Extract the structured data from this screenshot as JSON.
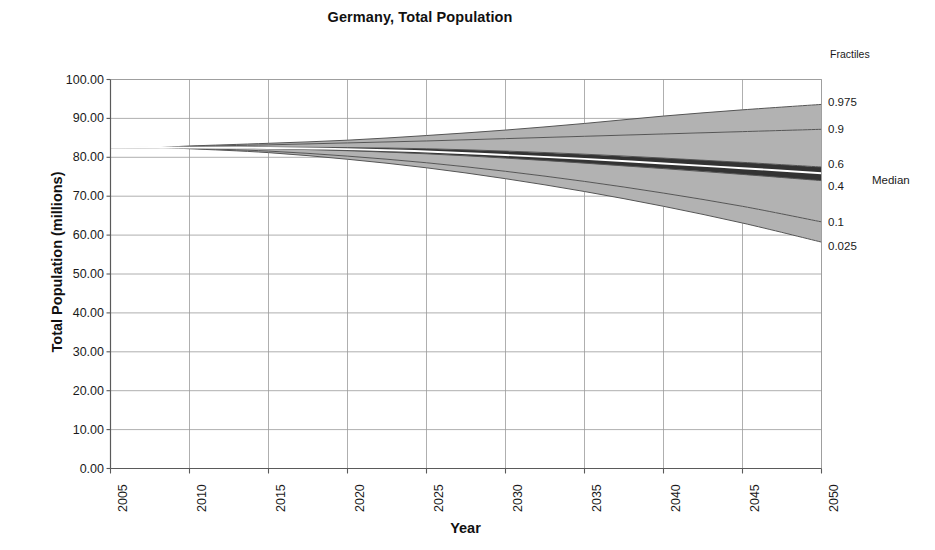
{
  "chart_data": {
    "type": "area",
    "title": "Germany, Total Population",
    "xlabel": "Year",
    "ylabel": "Total Population (millions)",
    "xlim": [
      2005,
      2050
    ],
    "ylim": [
      0,
      100
    ],
    "grid": true,
    "legend_position": "right",
    "legend_title": "Fractiles",
    "x_ticks": [
      "2005",
      "2010",
      "2015",
      "2020",
      "2025",
      "2030",
      "2035",
      "2040",
      "2045",
      "2050"
    ],
    "y_ticks": [
      "0.00",
      "10.00",
      "20.00",
      "30.00",
      "40.00",
      "50.00",
      "60.00",
      "70.00",
      "80.00",
      "90.00",
      "100.00"
    ],
    "x": [
      2005,
      2008,
      2010,
      2015,
      2020,
      2025,
      2030,
      2035,
      2040,
      2045,
      2050
    ],
    "series": [
      {
        "name": "0.975",
        "label": "0.975",
        "values": [
          82.5,
          82.5,
          82.9,
          83.6,
          84.4,
          85.6,
          87.0,
          88.7,
          90.6,
          92.2,
          93.6
        ]
      },
      {
        "name": "0.9",
        "label": "0.9",
        "values": [
          82.5,
          82.5,
          82.8,
          83.2,
          83.7,
          84.2,
          84.8,
          85.4,
          86.0,
          86.6,
          87.2
        ]
      },
      {
        "name": "0.6",
        "label": "0.6",
        "values": [
          82.5,
          82.5,
          82.6,
          82.6,
          82.5,
          82.2,
          81.6,
          80.8,
          79.8,
          78.7,
          77.5
        ]
      },
      {
        "name": "Median",
        "label": "Median",
        "values": [
          82.5,
          82.5,
          82.5,
          82.4,
          82.1,
          81.5,
          80.6,
          79.6,
          78.4,
          77.2,
          75.9
        ]
      },
      {
        "name": "0.4",
        "label": "0.4",
        "values": [
          82.5,
          82.5,
          82.5,
          82.2,
          81.7,
          80.9,
          79.8,
          78.5,
          77.1,
          75.6,
          74.0
        ]
      },
      {
        "name": "0.1",
        "label": "0.1",
        "values": [
          82.5,
          82.5,
          82.3,
          81.6,
          80.3,
          78.6,
          76.4,
          73.8,
          70.8,
          67.4,
          63.4
        ]
      },
      {
        "name": "0.025",
        "label": "0.025",
        "values": [
          82.5,
          82.5,
          82.2,
          81.2,
          79.5,
          77.3,
          74.5,
          71.2,
          67.4,
          63.1,
          58.2
        ]
      }
    ],
    "bands": [
      {
        "name": "0.025-0.1",
        "lower": "0.025",
        "upper": "0.1",
        "color": "#b2b2b2"
      },
      {
        "name": "0.1-0.4",
        "lower": "0.1",
        "upper": "0.4",
        "color": "#b2b2b2"
      },
      {
        "name": "0.4-median",
        "lower": "0.4",
        "upper": "Median",
        "color": "#333333"
      },
      {
        "name": "median-0.6",
        "lower": "Median",
        "upper": "0.6",
        "color": "#333333"
      },
      {
        "name": "0.6-0.9",
        "lower": "0.6",
        "upper": "0.9",
        "color": "#b2b2b2"
      },
      {
        "name": "0.9-0.975",
        "lower": "0.9",
        "upper": "0.975",
        "color": "#b2b2b2"
      }
    ],
    "colors": {
      "band_light": "#b2b2b2",
      "band_dark": "#333333",
      "median_line": "#ffffff",
      "outline": "#555555",
      "grid": "#9a9a9a",
      "axis": "#5a5a5a",
      "text": "#1a1a1a"
    }
  }
}
